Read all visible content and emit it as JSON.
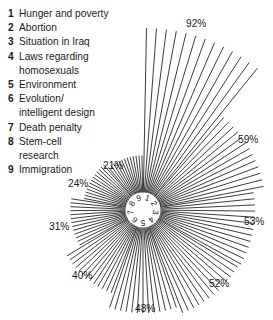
{
  "legend": {
    "items": [
      {
        "num": "1",
        "label": "Hunger and poverty"
      },
      {
        "num": "2",
        "label": "Abortion"
      },
      {
        "num": "3",
        "label": "Situation in Iraq"
      },
      {
        "num": "4",
        "label": "Laws regarding",
        "label2": "homosexuals"
      },
      {
        "num": "5",
        "label": "Environment"
      },
      {
        "num": "6",
        "label": "Evolution/",
        "label2": "intelligent design"
      },
      {
        "num": "7",
        "label": "Death penalty"
      },
      {
        "num": "8",
        "label": "Stem-cell",
        "label2": "research"
      },
      {
        "num": "9",
        "label": "Immigration"
      }
    ]
  },
  "center_labels": [
    "1",
    "2",
    "3",
    "4",
    "5",
    "6",
    "7",
    "8",
    "9"
  ],
  "callouts": [
    {
      "text": "92%",
      "x": 186,
      "y": 18
    },
    {
      "text": "59%",
      "x": 238,
      "y": 134
    },
    {
      "text": "53%",
      "x": 244,
      "y": 216
    },
    {
      "text": "52%",
      "x": 209,
      "y": 278
    },
    {
      "text": "48%",
      "x": 135,
      "y": 303
    },
    {
      "text": "40%",
      "x": 72,
      "y": 270
    },
    {
      "text": "31%",
      "x": 49,
      "y": 221
    },
    {
      "text": "24%",
      "x": 68,
      "y": 178
    },
    {
      "text": "21%",
      "x": 103,
      "y": 160
    }
  ],
  "chart_data": {
    "type": "bar",
    "subtype": "radial-starburst",
    "categories": [
      "Hunger and poverty",
      "Abortion",
      "Situation in Iraq",
      "Laws regarding homosexuals",
      "Environment",
      "Evolution/intelligent design",
      "Death penalty",
      "Stem-cell research",
      "Immigration"
    ],
    "category_numbers": [
      "1",
      "2",
      "3",
      "4",
      "5",
      "6",
      "7",
      "8",
      "9"
    ],
    "values": [
      92,
      59,
      53,
      52,
      48,
      40,
      31,
      24,
      21
    ],
    "value_labels": [
      "92%",
      "59%",
      "53%",
      "52%",
      "48%",
      "40%",
      "31%",
      "24%",
      "21%"
    ],
    "unit": "%",
    "title": "",
    "xlabel": "",
    "ylabel": "",
    "ylim": [
      0,
      92
    ],
    "grid": false,
    "legend_position": "top-left",
    "colors": {
      "ray": "#262626",
      "text": "#1a1a1a",
      "background": "#ffffff"
    },
    "layout": {
      "center_x": 143,
      "center_y": 210,
      "inner_radius": 17,
      "max_radius": 182,
      "start_angle_deg": 0,
      "sector_span_deg": 40,
      "direction": "clockwise",
      "rays_per_sector": 13
    }
  }
}
